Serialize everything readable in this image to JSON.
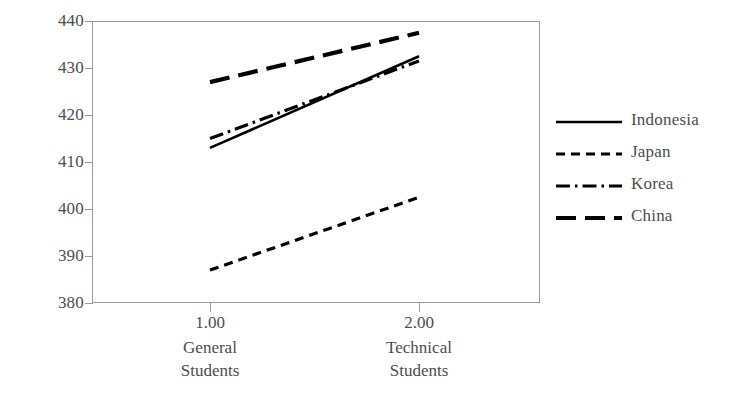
{
  "chart_data": {
    "type": "line",
    "title": "",
    "subtitle": "",
    "xlabel": "",
    "ylabel": "",
    "grid": false,
    "legend_position": "right",
    "x": [
      1.0,
      2.0
    ],
    "x_tick_labels": [
      "1.00",
      "2.00"
    ],
    "x_group_labels": [
      {
        "line1": "General",
        "line2": "Students"
      },
      {
        "line1": "Technical",
        "line2": "Students"
      }
    ],
    "categories": [
      "General Students",
      "Technical Students"
    ],
    "ylim": [
      380,
      440
    ],
    "y_ticks": [
      380,
      390,
      400,
      410,
      420,
      430,
      440
    ],
    "y_tick_labels": [
      "380",
      "390",
      "400",
      "410",
      "420",
      "430",
      "440"
    ],
    "series": [
      {
        "name": "Indonesia",
        "values": [
          413.0,
          432.5
        ],
        "dash": "solid",
        "color": "#000000"
      },
      {
        "name": "Japan",
        "values": [
          387.0,
          402.5
        ],
        "dash": "dashed",
        "color": "#000000"
      },
      {
        "name": "Korea",
        "values": [
          415.0,
          431.5
        ],
        "dash": "dash-dot",
        "color": "#000000"
      },
      {
        "name": "China",
        "values": [
          427.0,
          437.5
        ],
        "dash": "long-dash",
        "color": "#000000"
      }
    ]
  },
  "axes": {
    "frame_color": "#9a9a9a",
    "text_color": "#4d4d4d"
  },
  "legend": {
    "items": [
      {
        "label": "Indonesia",
        "dash": "solid"
      },
      {
        "label": "Japan",
        "dash": "dashed"
      },
      {
        "label": "Korea",
        "dash": "dash-dot"
      },
      {
        "label": "China",
        "dash": "long-dash"
      }
    ]
  }
}
